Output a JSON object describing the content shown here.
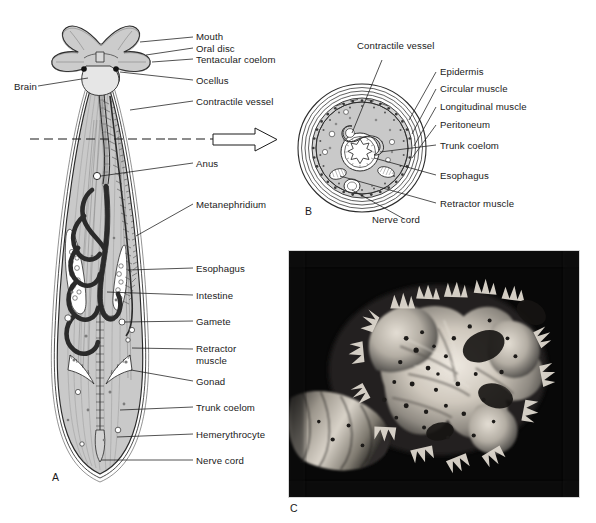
{
  "figure": {
    "background_color": "#ffffff",
    "ink_color": "#1a1a1a",
    "body_fill_color": "#c9c9c9"
  },
  "panels": [
    {
      "id": "A",
      "letter": "A",
      "type": "line-drawing",
      "caption": "Whole-body longitudinal view"
    },
    {
      "id": "B",
      "letter": "B",
      "type": "line-drawing",
      "caption": "Transverse cross-section"
    },
    {
      "id": "C",
      "letter": "C",
      "type": "photograph",
      "caption": "Photograph of tentacular crown"
    }
  ],
  "panel_a": {
    "letter": "A",
    "labels": [
      {
        "text": "Mouth",
        "side": "right"
      },
      {
        "text": "Oral disc",
        "side": "right"
      },
      {
        "text": "Tentacular coelom",
        "side": "right"
      },
      {
        "text": "Brain",
        "side": "left"
      },
      {
        "text": "Ocellus",
        "side": "right"
      },
      {
        "text": "Contractile vessel",
        "side": "right"
      },
      {
        "text": "Anus",
        "side": "right"
      },
      {
        "text": "Metanephridium",
        "side": "right"
      },
      {
        "text": "Esophagus",
        "side": "right"
      },
      {
        "text": "Intestine",
        "side": "right"
      },
      {
        "text": "Gamete",
        "side": "right"
      },
      {
        "text": "Retractor muscle",
        "side": "right"
      },
      {
        "text": "Gonad",
        "side": "right"
      },
      {
        "text": "Trunk coelom",
        "side": "right"
      },
      {
        "text": "Hemerythrocyte",
        "side": "right"
      },
      {
        "text": "Nerve cord",
        "side": "right"
      }
    ]
  },
  "panel_b": {
    "letter": "B",
    "labels": [
      {
        "text": "Contractile vessel",
        "side": "top"
      },
      {
        "text": "Epidermis",
        "side": "right"
      },
      {
        "text": "Circular muscle",
        "side": "right"
      },
      {
        "text": "Longitudinal muscle",
        "side": "right"
      },
      {
        "text": "Peritoneum",
        "side": "right"
      },
      {
        "text": "Trunk coelom",
        "side": "right"
      },
      {
        "text": "Esophagus",
        "side": "right"
      },
      {
        "text": "Retractor muscle",
        "side": "right"
      },
      {
        "text": "Nerve cord",
        "side": "bottom"
      }
    ]
  },
  "panel_c": {
    "letter": "C",
    "description": "Black and white photograph of a branching lophophore crown on dark background"
  },
  "section_indicator": {
    "style": "dashed-line-with-open-arrow",
    "meaning": "plane of section shown in panel B"
  }
}
